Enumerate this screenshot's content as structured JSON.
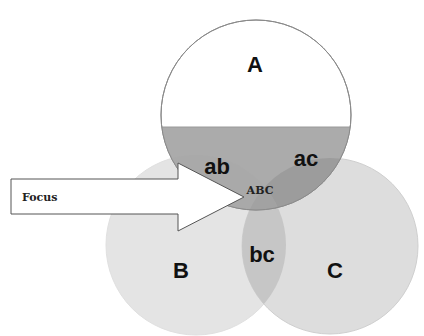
{
  "diagram": {
    "type": "venn-3",
    "sets": [
      {
        "id": "A",
        "label": "A"
      },
      {
        "id": "B",
        "label": "B"
      },
      {
        "id": "C",
        "label": "C"
      }
    ],
    "intersections": {
      "ab": "ab",
      "ac": "ac",
      "bc": "bc",
      "abc": "ABC"
    },
    "arrow": {
      "label": "Focus",
      "points_to": "ABC"
    },
    "colors": {
      "circle_a_top": "#ffffff",
      "circle_a_bottom": "#a6a6a6",
      "circle_b": "#e3e3e3",
      "circle_c": "#dcdcdc",
      "overlap_bc": "#c4c4c4",
      "overlap_ac": "#9a9a9a",
      "outline": "#8a8a8a"
    }
  }
}
